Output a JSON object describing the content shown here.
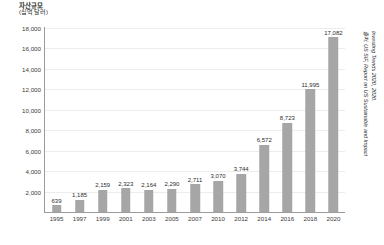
{
  "axis_title": {
    "line1": "자산규모",
    "line2": "(십억 달러)"
  },
  "source": {
    "line1": "출처: US SIF, Report on US Sustainable and Impact",
    "line2": "Investing Trends 2020, 2020."
  },
  "colors": {
    "bar": "#a6a6a6",
    "grid": "#ededf0",
    "axis": "#9a9a9a",
    "text": "#2d2d2d"
  },
  "chart_data": {
    "type": "bar",
    "title": "자산규모 (십억 달러)",
    "xlabel": "",
    "ylabel": "자산규모 (십억 달러)",
    "ylim": [
      0,
      18000
    ],
    "ytick_labels": [
      "18,000",
      "16,000",
      "14,000",
      "12,000",
      "10,000",
      "8,000",
      "6,000",
      "4,000",
      "2,000"
    ],
    "yticks": [
      18000,
      16000,
      14000,
      12000,
      10000,
      8000,
      6000,
      4000,
      2000
    ],
    "grid": true,
    "legend": null,
    "categories": [
      "1995",
      "1997",
      "1999",
      "2001",
      "2003",
      "2005",
      "2007",
      "2010",
      "2012",
      "2014",
      "2016",
      "2018",
      "2020"
    ],
    "values": [
      639,
      1185,
      2159,
      2323,
      2164,
      2290,
      2711,
      3070,
      3744,
      6572,
      8723,
      11995,
      17082
    ],
    "value_labels": [
      "639",
      "1,185",
      "2,159",
      "2,323",
      "2,164",
      "2,290",
      "2,711",
      "3,070",
      "3,744",
      "6,572",
      "8,723",
      "11,995",
      "17,082"
    ]
  }
}
